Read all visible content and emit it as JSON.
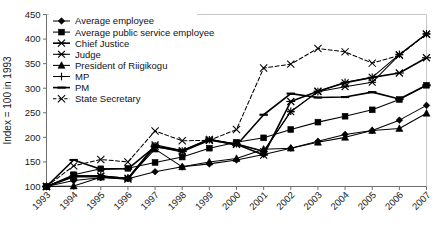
{
  "chart_data": {
    "type": "line",
    "title": "",
    "xlabel": "",
    "ylabel": "Index = 100 in 1993",
    "ylim": [
      100,
      450
    ],
    "yticks": [
      100,
      150,
      200,
      250,
      300,
      350,
      400,
      450
    ],
    "grid": false,
    "legend_position": "top-left",
    "categories": [
      "1993",
      "1994",
      "1995",
      "1996",
      "1997",
      "1998",
      "1999",
      "2000",
      "2001",
      "2002",
      "2003",
      "2004",
      "2005",
      "2006",
      "2007"
    ],
    "series": [
      {
        "name": "Average employee",
        "marker": "diamond",
        "values": [
          100,
          112,
          118,
          116,
          130,
          140,
          146,
          154,
          165,
          178,
          192,
          206,
          214,
          235,
          265
        ]
      },
      {
        "name": "Average public service employee",
        "marker": "square",
        "values": [
          100,
          124,
          136,
          137,
          149,
          160,
          178,
          190,
          199,
          216,
          231,
          243,
          256,
          277,
          306
        ]
      },
      {
        "name": "Chief Justice",
        "marker": "bowtie",
        "values": [
          100,
          120,
          120,
          115,
          182,
          171,
          194,
          186,
          164,
          273,
          294,
          311,
          322,
          331,
          362
        ]
      },
      {
        "name": "Judge",
        "marker": "asterisk",
        "values": [
          100,
          122,
          122,
          117,
          185,
          173,
          196,
          186,
          171,
          252,
          293,
          303,
          312,
          368,
          410
        ]
      },
      {
        "name": "President of Riigikogu",
        "marker": "triangle",
        "values": [
          100,
          101,
          119,
          117,
          176,
          140,
          150,
          157,
          176,
          178,
          190,
          200,
          214,
          218,
          249
        ]
      },
      {
        "name": "MP",
        "marker": "plus",
        "values": [
          100,
          122,
          122,
          117,
          183,
          172,
          195,
          187,
          172,
          253,
          293,
          312,
          322,
          369,
          411
        ]
      },
      {
        "name": "PM",
        "marker": "dash",
        "values": [
          100,
          154,
          135,
          136,
          181,
          173,
          196,
          184,
          246,
          289,
          281,
          282,
          292,
          278,
          306
        ]
      },
      {
        "name": "State Secretary",
        "marker": "cross",
        "values": [
          100,
          142,
          155,
          150,
          213,
          193,
          194,
          216,
          341,
          349,
          381,
          374,
          351,
          367,
          410
        ]
      }
    ]
  }
}
